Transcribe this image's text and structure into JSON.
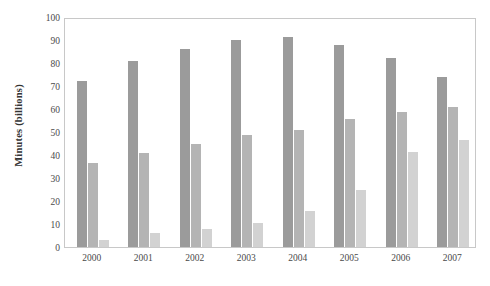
{
  "chart_data": {
    "type": "bar",
    "title": "",
    "subtitle": "",
    "xlabel": "",
    "ylabel": "Minutes (billions)",
    "categories": [
      "2000",
      "2001",
      "2002",
      "2003",
      "2004",
      "2005",
      "2006",
      "2007"
    ],
    "series": [
      {
        "name": "series-1",
        "color": "#9b9b9b",
        "values": [
          72,
          81,
          86,
          90,
          91.5,
          88,
          82,
          74
        ]
      },
      {
        "name": "series-2",
        "color": "#b4b4b4",
        "values": [
          36.5,
          41,
          45,
          48.5,
          51,
          55.5,
          58.5,
          61
        ]
      },
      {
        "name": "series-3",
        "color": "#d2d2d2",
        "values": [
          3,
          6,
          8,
          10.5,
          15.5,
          25,
          41.5,
          46.5
        ]
      }
    ],
    "ylim": [
      0,
      100
    ],
    "ytick_values": [
      0,
      10,
      20,
      30,
      40,
      50,
      60,
      70,
      80,
      90,
      100
    ],
    "ytick_labels": [
      "0",
      "10",
      "20",
      "30",
      "40",
      "50",
      "60",
      "70",
      "80",
      "90",
      "100"
    ],
    "grid": false,
    "legend": "none",
    "plot_border_color": "#c8c8c8",
    "background_color": "#ffffff"
  }
}
